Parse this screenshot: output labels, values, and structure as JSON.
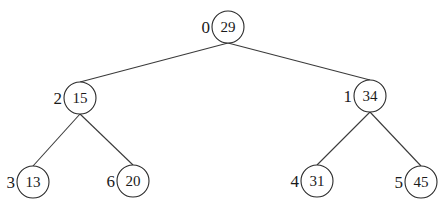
{
  "diagram": {
    "type": "binary-tree",
    "nodes": [
      {
        "index": "0",
        "value": "29",
        "cx": 228,
        "cy": 27
      },
      {
        "index": "2",
        "value": "15",
        "cx": 80,
        "cy": 98
      },
      {
        "index": "1",
        "value": "34",
        "cx": 370,
        "cy": 96
      },
      {
        "index": "3",
        "value": "13",
        "cx": 33,
        "cy": 182
      },
      {
        "index": "6",
        "value": "20",
        "cx": 133,
        "cy": 181
      },
      {
        "index": "4",
        "value": "31",
        "cx": 317,
        "cy": 181
      },
      {
        "index": "5",
        "value": "45",
        "cx": 421,
        "cy": 182
      }
    ],
    "edges": [
      {
        "from": "0",
        "to": "2"
      },
      {
        "from": "0",
        "to": "1"
      },
      {
        "from": "2",
        "to": "3"
      },
      {
        "from": "2",
        "to": "6"
      },
      {
        "from": "1",
        "to": "4"
      },
      {
        "from": "1",
        "to": "5"
      }
    ],
    "radius": 16
  }
}
